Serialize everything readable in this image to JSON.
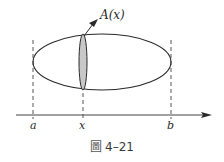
{
  "figure": {
    "label_area": "A(x)",
    "label_a": "a",
    "label_x": "x",
    "label_b": "b",
    "caption_prefix": "圖",
    "caption_number": "4–21"
  },
  "geometry": {
    "ellipse": {
      "cx": 102,
      "cy": 62,
      "rx": 69,
      "ry": 28
    },
    "cross_section": {
      "cx": 83,
      "cy": 62,
      "rx": 4,
      "ry": 28
    },
    "axis": {
      "y": 115,
      "x_start": 16,
      "x_end": 212
    },
    "dashed_lines_x": [
      33,
      83,
      171
    ]
  },
  "colors": {
    "stroke": "#2a2a2a",
    "shade": "#c8c8c8",
    "background": "#ffffff"
  }
}
